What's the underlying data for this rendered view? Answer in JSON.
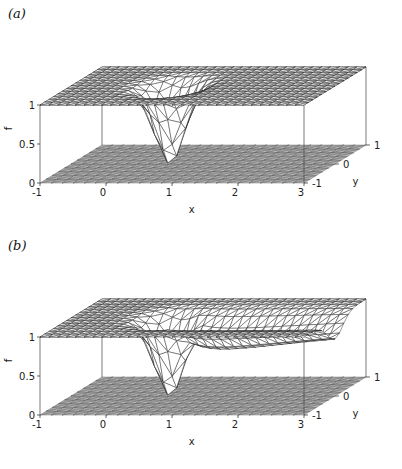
{
  "chart_data": [
    {
      "type": "surface3d",
      "panel_label": "(a)",
      "title": "",
      "xlabel": "x",
      "ylabel": "y",
      "zlabel": "f",
      "xlim": [
        -1,
        3
      ],
      "ylim": [
        -1,
        1
      ],
      "zlim": [
        0,
        1
      ],
      "xticks": [
        "-1",
        "0",
        "1",
        "2",
        "3"
      ],
      "yticks": [
        "-1",
        "0",
        "1"
      ],
      "zticks": [
        "0",
        "0.5",
        "1"
      ],
      "surface": {
        "description": "Triangulated mesh, f≈1 far field with a localized dip to f≈0 near (x,y)=(0.5,0)",
        "dip_center": [
          0.5,
          0.0
        ],
        "dip_min": 0.0,
        "far_value": 1.0,
        "wake": false
      },
      "base_plane": "shaded triangulated mesh at f=0"
    },
    {
      "type": "surface3d",
      "panel_label": "(b)",
      "title": "",
      "xlabel": "x",
      "ylabel": "y",
      "zlabel": "f",
      "xlim": [
        -1,
        3
      ],
      "ylim": [
        -1,
        1
      ],
      "zlim": [
        0,
        1
      ],
      "xticks": [
        "-1",
        "0",
        "1",
        "2",
        "3"
      ],
      "yticks": [
        "-1",
        "0",
        "1"
      ],
      "zticks": [
        "0",
        "0.5",
        "1"
      ],
      "surface": {
        "description": "Triangulated mesh, f≈1 far field with a dip to f≈0 near (x,y)=(0.5,0) and a depressed wake trailing toward x=3",
        "dip_center": [
          0.5,
          0.0
        ],
        "dip_min": 0.0,
        "far_value": 1.0,
        "wake": true
      },
      "base_plane": "shaded triangulated mesh at f=0"
    }
  ]
}
